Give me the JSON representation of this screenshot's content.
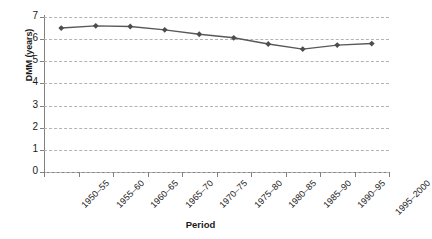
{
  "chart_data": {
    "type": "line",
    "title": "",
    "xlabel": "Period",
    "ylabel": "DMM (years)",
    "categories": [
      "1950–55",
      "1955–60",
      "1960–65",
      "1965–70",
      "1970–75",
      "1975–80",
      "1980–85",
      "1985–90",
      "1990–95",
      "1995–2000"
    ],
    "values": [
      6.5,
      6.6,
      6.57,
      6.42,
      6.22,
      6.06,
      5.78,
      5.55,
      5.73,
      5.8
    ],
    "series": [
      {
        "name": "DMM",
        "values": [
          6.5,
          6.6,
          6.57,
          6.42,
          6.22,
          6.06,
          5.78,
          5.55,
          5.73,
          5.8
        ]
      }
    ],
    "ylim": [
      0,
      7
    ],
    "ytick_labels": [
      "7",
      "6",
      "5",
      "4",
      "3",
      "2",
      "1",
      "0"
    ],
    "ytick_values": [
      7,
      6,
      5,
      4,
      3,
      2,
      1,
      0
    ],
    "grid": true,
    "grid_style": "dashed-horizontal",
    "legend": false,
    "legend_position": "none",
    "marker": "diamond",
    "colors": {
      "line": "#595959",
      "marker": "#4d4d4d",
      "grid": "#b3b3b3",
      "axis": "#808080",
      "text": "#1a1a1a",
      "background": "#ffffff"
    }
  },
  "axis": {
    "x_title": "Period",
    "y_title": "DMM (years)"
  }
}
